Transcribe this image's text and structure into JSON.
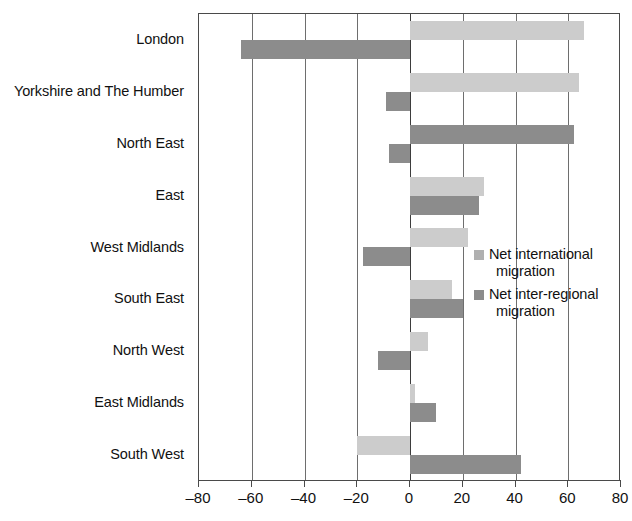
{
  "chart_data": {
    "type": "bar",
    "orientation": "horizontal",
    "title": "",
    "xlabel": "",
    "ylabel": "",
    "xlim": [
      -80,
      80
    ],
    "xticks": [
      -80,
      -60,
      -40,
      -20,
      0,
      20,
      40,
      60,
      80
    ],
    "xtick_labels": [
      "–80",
      "–60",
      "–40",
      "–20",
      "0",
      "20",
      "40",
      "60",
      "80"
    ],
    "grid": true,
    "legend_position": "center-right",
    "categories": [
      "London",
      "Yorkshire and The Humber",
      "North East",
      "East",
      "West Midlands",
      "South East",
      "North West",
      "East Midlands",
      "South West"
    ],
    "series": [
      {
        "name": "Net international migration",
        "color": "#cccccc",
        "values": [
          66,
          64,
          62,
          28,
          22,
          16,
          7,
          2,
          -20
        ]
      },
      {
        "name": "Net inter-regional migration",
        "color": "#8c8c8c",
        "values": [
          -64,
          -9,
          -8,
          26,
          -18,
          20,
          -12,
          10,
          42
        ]
      }
    ]
  },
  "legend": {
    "items": [
      {
        "swatch": "intl",
        "line1": "Net international",
        "line2": "migration"
      },
      {
        "swatch": "inter",
        "line1": "Net inter-regional",
        "line2": "migration"
      }
    ]
  }
}
